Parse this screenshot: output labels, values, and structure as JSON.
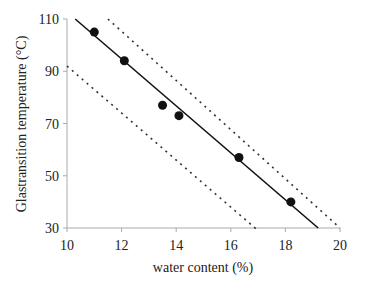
{
  "chart_data": {
    "type": "scatter",
    "title": "",
    "xlabel": "water content  (%)",
    "ylabel": "Glastransition temperature  (°C)",
    "xlim": [
      10,
      20
    ],
    "ylim": [
      30,
      110
    ],
    "x_ticks": [
      "10",
      "12",
      "14",
      "16",
      "18",
      "20"
    ],
    "y_ticks": [
      "30",
      "50",
      "70",
      "90",
      "110"
    ],
    "grid": false,
    "legend": null,
    "series": [
      {
        "name": "measured",
        "type": "scatter",
        "points": [
          [
            11.0,
            105
          ],
          [
            12.1,
            94
          ],
          [
            13.5,
            77
          ],
          [
            14.1,
            73
          ],
          [
            16.3,
            57
          ],
          [
            18.2,
            40
          ]
        ]
      },
      {
        "name": "regression line",
        "type": "line",
        "style": "solid",
        "points": [
          [
            10.3,
            110
          ],
          [
            19.2,
            30
          ]
        ]
      },
      {
        "name": "upper bound",
        "type": "line",
        "style": "dotted",
        "points": [
          [
            11.5,
            110
          ],
          [
            20.0,
            30
          ]
        ]
      },
      {
        "name": "lower bound",
        "type": "line",
        "style": "dotted",
        "points": [
          [
            10.0,
            92
          ],
          [
            17.0,
            29
          ]
        ]
      }
    ]
  }
}
